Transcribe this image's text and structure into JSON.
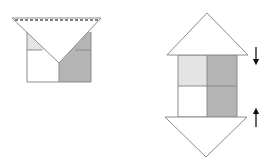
{
  "diagram": {
    "colors": {
      "background": "#ffffff",
      "line": "#8c8c8c",
      "light_fill": "#e4e4e4",
      "dark_fill": "#b4b4b4",
      "arrow": "#111111",
      "dashed": "#555555"
    },
    "left_figure": {
      "square": {
        "x": 27,
        "y": 32,
        "w": 64,
        "h": 50
      },
      "triangle": {
        "points": [
          [
            12,
            18
          ],
          [
            101,
            18
          ],
          [
            59,
            63
          ]
        ]
      },
      "fold_line": {
        "type": "dashed",
        "x1": 15,
        "x2": 98,
        "y": 20
      },
      "cells": [
        {
          "name": "top-left",
          "fill": "light"
        },
        {
          "name": "top-right",
          "fill": "dark"
        },
        {
          "name": "bottom-left",
          "fill": "none"
        },
        {
          "name": "bottom-right",
          "fill": "dark"
        }
      ]
    },
    "right_figure": {
      "square": {
        "x": 178,
        "y": 55,
        "w": 59,
        "h": 62
      },
      "top_triangle": {
        "points": [
          [
            167,
            55
          ],
          [
            248,
            55
          ],
          [
            207,
            13
          ]
        ]
      },
      "bottom_triangle": {
        "points": [
          [
            165,
            117
          ],
          [
            247,
            117
          ],
          [
            206,
            157
          ]
        ]
      },
      "cells": [
        {
          "name": "top-left",
          "fill": "light"
        },
        {
          "name": "top-right",
          "fill": "dark"
        },
        {
          "name": "bottom-left",
          "fill": "none"
        },
        {
          "name": "bottom-right",
          "fill": "dark"
        }
      ],
      "arrows": [
        {
          "direction": "down",
          "x": 256,
          "y1": 47,
          "y2": 63
        },
        {
          "direction": "up",
          "x": 256,
          "y1": 110,
          "y2": 127
        }
      ]
    }
  }
}
